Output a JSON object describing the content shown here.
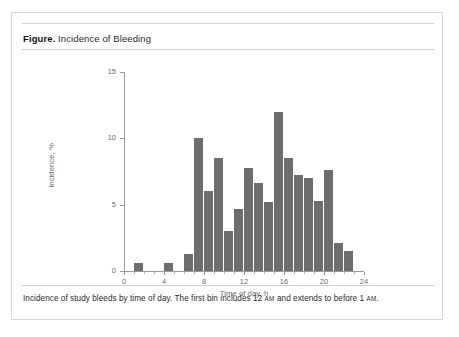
{
  "figure": {
    "label": "Figure.",
    "title": " Incidence of Bleeding",
    "caption_part1": "Incidence of study bleeds by time of day. The first bin includes 12 ",
    "caption_am1": "AM",
    "caption_part2": " and extends to before 1 ",
    "caption_am2": "AM",
    "caption_part3": "."
  },
  "colors": {
    "bar": "#6d6d6d",
    "axis": "#9a9a9a",
    "text": "#6b6b6b",
    "card_border": "#d8d8d8",
    "rule": "#cfcfcf"
  },
  "chart_data": {
    "type": "bar",
    "title": "Incidence of Bleeding",
    "xlabel": "Time of day, h",
    "ylabel": "Incidence, %",
    "xlim": [
      0,
      24
    ],
    "ylim": [
      0,
      15
    ],
    "xticks": [
      0,
      4,
      8,
      12,
      16,
      20,
      24
    ],
    "xtick_labels": [
      "0",
      "4",
      "8",
      "12",
      "16",
      "20",
      "24"
    ],
    "yticks": [
      0,
      5,
      10,
      15
    ],
    "ytick_labels": [
      "0",
      "5",
      "10",
      "15"
    ],
    "grid": false,
    "legend": null,
    "bin_width": 1,
    "categories": [
      "0",
      "1",
      "2",
      "3",
      "4",
      "5",
      "6",
      "7",
      "8",
      "9",
      "10",
      "11",
      "12",
      "13",
      "14",
      "15",
      "16",
      "17",
      "18",
      "19",
      "20",
      "21",
      "22",
      "23"
    ],
    "values": [
      0,
      0.6,
      0,
      0,
      0.6,
      0,
      1.3,
      10.0,
      6.0,
      8.5,
      3.0,
      4.7,
      7.8,
      6.6,
      5.2,
      12.0,
      8.5,
      7.2,
      7.0,
      5.3,
      7.6,
      2.1,
      1.5,
      0
    ]
  }
}
